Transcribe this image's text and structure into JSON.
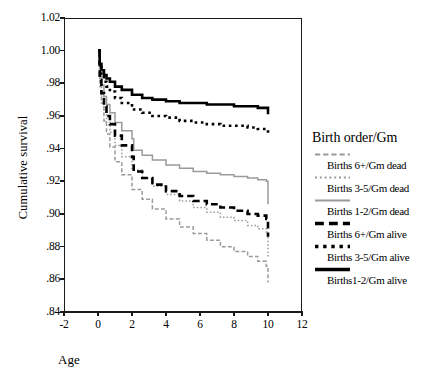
{
  "chart_data": {
    "type": "line",
    "title": "",
    "xlabel": "Age",
    "ylabel": "Cumulative survival",
    "xlim": [
      -2,
      12
    ],
    "ylim": [
      0.84,
      1.02
    ],
    "xticks": [
      "-2",
      "0",
      "2",
      "4",
      "6",
      "8",
      "10",
      "12"
    ],
    "yticks": [
      "1.02",
      "1.00",
      ".98",
      ".96",
      ".94",
      ".92",
      ".90",
      ".88",
      ".86",
      ".84"
    ],
    "grid": false,
    "legend_position": "right",
    "legend_title": "Birth order/Gm",
    "series": [
      {
        "name": "Births 6+/Gm dead",
        "color": "#9a9a9a",
        "style": "dashed",
        "x": [
          0,
          0.1,
          0.2,
          0.35,
          0.5,
          0.7,
          1.0,
          1.4,
          2.0,
          2.6,
          3.2,
          4.0,
          4.8,
          5.6,
          6.4,
          7.2,
          8.0,
          8.8,
          9.4,
          9.9,
          10.0
        ],
        "y": [
          1.0,
          0.978,
          0.968,
          0.957,
          0.949,
          0.941,
          0.932,
          0.924,
          0.915,
          0.909,
          0.903,
          0.897,
          0.892,
          0.888,
          0.884,
          0.88,
          0.877,
          0.874,
          0.871,
          0.868,
          0.858
        ]
      },
      {
        "name": "Births 3-5/Gm dead",
        "color": "#9a9a9a",
        "style": "dotted",
        "x": [
          0,
          0.1,
          0.2,
          0.35,
          0.5,
          0.7,
          1.0,
          1.4,
          2.0,
          2.6,
          3.2,
          4.0,
          4.8,
          5.6,
          6.4,
          7.2,
          8.0,
          8.8,
          9.4,
          9.9,
          10.0
        ],
        "y": [
          1.0,
          0.981,
          0.972,
          0.963,
          0.956,
          0.95,
          0.942,
          0.935,
          0.927,
          0.922,
          0.917,
          0.912,
          0.908,
          0.904,
          0.901,
          0.898,
          0.896,
          0.893,
          0.891,
          0.889,
          0.874
        ]
      },
      {
        "name": "Births 1-2/Gm dead",
        "color": "#9a9a9a",
        "style": "solid",
        "x": [
          0,
          0.1,
          0.2,
          0.35,
          0.5,
          0.7,
          1.0,
          1.4,
          2.0,
          2.1,
          2.6,
          3.2,
          4.0,
          4.8,
          5.6,
          6.4,
          7.2,
          8.0,
          8.8,
          9.4,
          9.9,
          10.0
        ],
        "y": [
          1.0,
          0.986,
          0.979,
          0.972,
          0.967,
          0.962,
          0.956,
          0.951,
          0.946,
          0.939,
          0.936,
          0.933,
          0.93,
          0.928,
          0.926,
          0.925,
          0.924,
          0.923,
          0.922,
          0.921,
          0.92,
          0.906
        ]
      },
      {
        "name": "Births 6+/Gm alive",
        "color": "#000000",
        "style": "dashed",
        "x": [
          0,
          0.1,
          0.2,
          0.35,
          0.5,
          0.7,
          1.0,
          1.4,
          2.0,
          2.1,
          2.6,
          3.2,
          4.0,
          4.8,
          5.6,
          6.4,
          7.2,
          8.0,
          8.8,
          9.4,
          9.9,
          10.0
        ],
        "y": [
          1.0,
          0.982,
          0.974,
          0.966,
          0.96,
          0.955,
          0.948,
          0.942,
          0.935,
          0.926,
          0.922,
          0.918,
          0.914,
          0.911,
          0.908,
          0.906,
          0.904,
          0.902,
          0.9,
          0.899,
          0.897,
          0.886
        ]
      },
      {
        "name": "Births 3-5/Gm alive",
        "color": "#000000",
        "style": "dotted",
        "x": [
          0,
          0.1,
          0.2,
          0.35,
          0.5,
          0.7,
          1.0,
          1.4,
          2.0,
          2.6,
          3.2,
          4.0,
          4.8,
          5.6,
          6.4,
          7.2,
          8.0,
          8.8,
          9.4,
          9.9,
          10.0
        ],
        "y": [
          1.0,
          0.99,
          0.985,
          0.981,
          0.978,
          0.975,
          0.971,
          0.968,
          0.964,
          0.962,
          0.96,
          0.959,
          0.957,
          0.956,
          0.955,
          0.954,
          0.954,
          0.953,
          0.952,
          0.952,
          0.949
        ]
      },
      {
        "name": "Births1-2/Gm alive",
        "color": "#000000",
        "style": "solid",
        "x": [
          0,
          0.1,
          0.2,
          0.35,
          0.5,
          0.7,
          1.0,
          1.4,
          2.0,
          2.6,
          3.2,
          4.0,
          4.8,
          5.6,
          6.4,
          7.2,
          8.0,
          8.8,
          9.4,
          9.9,
          10.0
        ],
        "y": [
          1.0,
          0.992,
          0.988,
          0.985,
          0.983,
          0.981,
          0.978,
          0.976,
          0.973,
          0.971,
          0.97,
          0.969,
          0.968,
          0.968,
          0.967,
          0.967,
          0.966,
          0.966,
          0.965,
          0.965,
          0.961
        ]
      }
    ]
  },
  "legend": {
    "title": "Birth order/Gm",
    "items": [
      {
        "label": "Births 6+/Gm dead",
        "color": "#9a9a9a",
        "style": "dashed"
      },
      {
        "label": "Births 3-5/Gm dead",
        "color": "#9a9a9a",
        "style": "dotted"
      },
      {
        "label": "Births 1-2/Gm dead",
        "color": "#9a9a9a",
        "style": "solid"
      },
      {
        "label": "Births 6+/Gm alive",
        "color": "#000000",
        "style": "dashed"
      },
      {
        "label": "Births 3-5/Gm alive",
        "color": "#000000",
        "style": "dotted"
      },
      {
        "label": "Births1-2/Gm alive",
        "color": "#000000",
        "style": "solid"
      }
    ]
  },
  "axes": {
    "x_title": "Age",
    "y_title": "Cumulative survival"
  }
}
